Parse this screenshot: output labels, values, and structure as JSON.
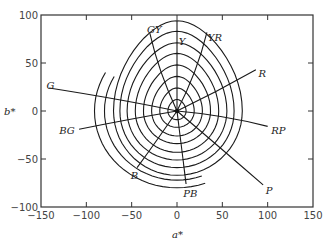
{
  "chart_data": {
    "type": "line",
    "title": "",
    "xlabel": "a*",
    "ylabel": "b*",
    "xlim": [
      -150,
      150
    ],
    "ylim": [
      -100,
      100
    ],
    "x_ticks": [
      -150,
      -100,
      -50,
      0,
      50,
      100,
      150
    ],
    "y_ticks": [
      100,
      50,
      0,
      -50,
      -100
    ],
    "grid": false,
    "legend": null,
    "hue_lines": [
      {
        "label": "G",
        "end": [
          -141,
          24
        ],
        "ctrl": [
          -60,
          12
        ],
        "label_pos": [
          -144,
          27
        ]
      },
      {
        "label": "BG",
        "end": [
          -108,
          -19
        ],
        "ctrl": [
          -50,
          -8
        ],
        "label_pos": [
          -130,
          -20
        ]
      },
      {
        "label": "B",
        "end": [
          -44,
          -59
        ],
        "ctrl": [
          -20,
          -28
        ],
        "label_pos": [
          -51,
          -67
        ]
      },
      {
        "label": "PB",
        "end": [
          10,
          -76
        ],
        "ctrl": [
          5,
          -38
        ],
        "label_pos": [
          7,
          -85
        ]
      },
      {
        "label": "P",
        "end": [
          95,
          -77
        ],
        "ctrl": [
          45,
          -36
        ],
        "label_pos": [
          98,
          -82
        ]
      },
      {
        "label": "RP",
        "end": [
          100,
          -16
        ],
        "ctrl": [
          50,
          -4
        ],
        "label_pos": [
          104,
          -20
        ]
      },
      {
        "label": "R",
        "end": [
          87,
          43
        ],
        "ctrl": [
          44,
          20
        ],
        "label_pos": [
          90,
          40
        ]
      },
      {
        "label": "YR",
        "end": [
          33,
          82
        ],
        "ctrl": [
          22,
          40
        ],
        "label_pos": [
          34,
          77
        ]
      },
      {
        "label": "Y",
        "end": [
          0,
          94
        ],
        "ctrl": [
          0,
          47
        ],
        "label_pos": [
          2,
          73
        ]
      },
      {
        "label": "GY",
        "end": [
          -30,
          81
        ],
        "ctrl": [
          -20,
          40
        ],
        "label_pos": [
          -33,
          85
        ]
      }
    ],
    "closed_contours": [
      {
        "right": 10,
        "top": 12,
        "left": -10,
        "bottom": -9
      },
      {
        "right": 19,
        "top": 24,
        "left": -19,
        "bottom": -17
      },
      {
        "right": 28,
        "top": 36,
        "left": -28,
        "bottom": -26
      },
      {
        "right": 37,
        "top": 48,
        "left": -37,
        "bottom": -34
      },
      {
        "right": 46,
        "top": 60,
        "left": -46,
        "bottom": -43
      },
      {
        "right": 55,
        "top": 71,
        "left": -55,
        "bottom": -51
      },
      {
        "right": 63,
        "top": 83,
        "left": -63,
        "bottom": -59
      },
      {
        "right": 72,
        "top": 94,
        "left": -70,
        "bottom": -67
      }
    ],
    "open_arcs": [
      {
        "start": [
          -76,
          27
        ],
        "left": -80,
        "bottom": -72,
        "end": [
          20,
          -73
        ]
      },
      {
        "start": [
          -87,
          27
        ],
        "left": -91,
        "bottom": -80,
        "end": [
          10,
          -81
        ]
      }
    ],
    "annotations": [
      "G",
      "BG",
      "B",
      "PB",
      "P",
      "RP",
      "R",
      "YR",
      "Y",
      "GY"
    ]
  },
  "axes": {
    "xlabel": "a*",
    "ylabel": "b*",
    "x_tick_labels": [
      "-150",
      "-100",
      "-50",
      "0",
      "50",
      "100",
      "150"
    ],
    "y_tick_labels": [
      "100",
      "50",
      "0",
      "-50",
      "-100"
    ]
  }
}
